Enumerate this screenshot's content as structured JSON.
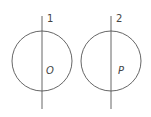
{
  "diagram": {
    "figures": [
      {
        "line_label": "1",
        "point_label": "O",
        "line_x": 42,
        "circle": {
          "cx": 42,
          "cy": 61,
          "r": 30
        }
      },
      {
        "line_label": "2",
        "point_label": "P",
        "line_x": 111,
        "circle": {
          "cx": 111,
          "cy": 61,
          "r": 30
        }
      }
    ],
    "stroke_color": "#555555"
  }
}
